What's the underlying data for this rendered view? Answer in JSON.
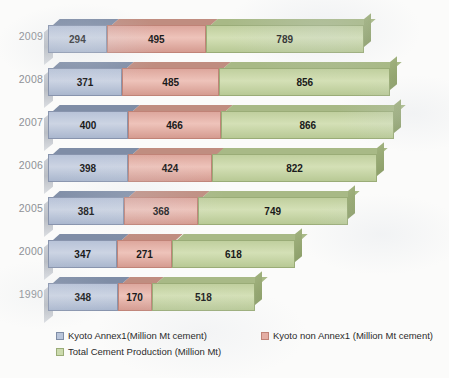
{
  "chart_data": {
    "type": "bar",
    "subtype": "horizontal-stacked-3d",
    "title": "",
    "xlabel": "",
    "ylabel": "",
    "categories": [
      "2009",
      "2008",
      "2007",
      "2006",
      "2005",
      "2000",
      "1990"
    ],
    "series": [
      {
        "name": "Kyoto Annex1(Million Mt cement)",
        "color": "#b9c5da",
        "values": [
          294,
          371,
          400,
          398,
          381,
          347,
          348
        ]
      },
      {
        "name": "Kyoto non Annex1 (Million Mt cement)",
        "color": "#e4aea4",
        "values": [
          495,
          485,
          466,
          424,
          368,
          271,
          170
        ]
      },
      {
        "name": "Total Cement Production (Million Mt)",
        "color": "#cbdaad",
        "values": [
          789,
          856,
          866,
          822,
          749,
          618,
          518
        ]
      }
    ],
    "totals": [
      1578,
      1712,
      1732,
      1644,
      1498,
      1236,
      1036
    ],
    "xlim": [
      0,
      1760
    ],
    "grid": false,
    "legend_position": "bottom-left"
  },
  "legend": {
    "items": [
      {
        "label": "Kyoto Annex1(Million Mt cement)",
        "swatch": "blue"
      },
      {
        "label": "Kyoto non Annex1 (Million Mt cement)",
        "swatch": "red"
      },
      {
        "label": "Total Cement Production (Million Mt)",
        "swatch": "green"
      }
    ]
  },
  "footnote": ""
}
